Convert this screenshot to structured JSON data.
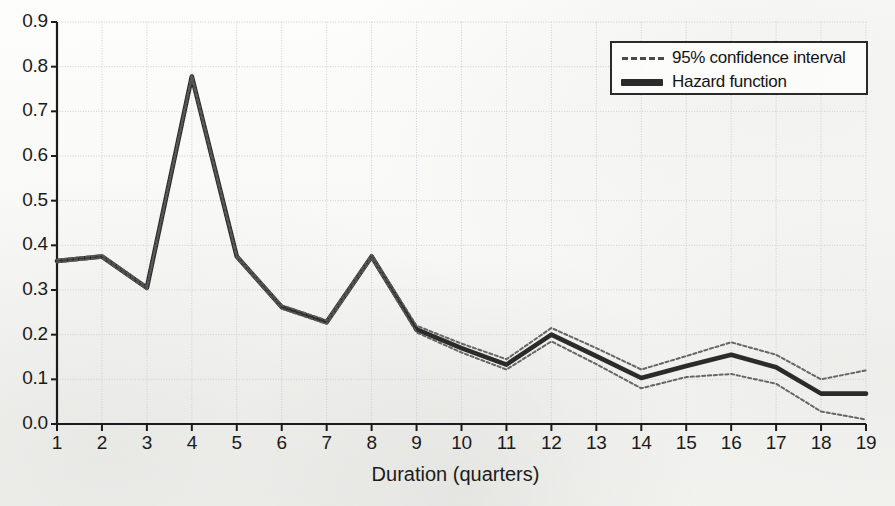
{
  "chart_data": {
    "type": "line",
    "title": "",
    "xlabel": "Duration (quarters)",
    "ylabel": "",
    "xlim": [
      1,
      19
    ],
    "ylim": [
      0.0,
      0.9
    ],
    "grid": true,
    "legend_position": "top-right",
    "x": [
      1,
      2,
      3,
      4,
      5,
      6,
      7,
      8,
      9,
      10,
      11,
      12,
      13,
      14,
      15,
      16,
      17,
      18,
      19
    ],
    "xtick_labels": [
      "1",
      "2",
      "3",
      "4",
      "5",
      "6",
      "7",
      "8",
      "9",
      "10",
      "11",
      "12",
      "13",
      "14",
      "15",
      "16",
      "17",
      "18",
      "19"
    ],
    "ytick_labels": [
      "0.0",
      "0.1",
      "0.2",
      "0.3",
      "0.4",
      "0.5",
      "0.6",
      "0.7",
      "0.8",
      "0.9"
    ],
    "ytick_values": [
      0.0,
      0.1,
      0.2,
      0.3,
      0.4,
      0.5,
      0.6,
      0.7,
      0.8,
      0.9
    ],
    "series": [
      {
        "name": "Hazard function",
        "style": "solid-thick",
        "color": "#2b2b2b",
        "values": [
          0.365,
          0.375,
          0.305,
          0.778,
          0.375,
          0.262,
          0.228,
          0.375,
          0.212,
          0.17,
          0.133,
          0.2,
          0.152,
          0.103,
          0.13,
          0.155,
          0.127,
          0.068,
          0.068
        ]
      },
      {
        "name": "95% confidence interval upper",
        "style": "dashed",
        "color": "#5a5a5a",
        "values": [
          0.368,
          0.378,
          0.308,
          0.782,
          0.378,
          0.266,
          0.232,
          0.379,
          0.22,
          0.18,
          0.145,
          0.215,
          0.17,
          0.122,
          0.152,
          0.183,
          0.155,
          0.1,
          0.12
        ]
      },
      {
        "name": "95% confidence interval lower",
        "style": "dashed",
        "color": "#5a5a5a",
        "values": [
          0.362,
          0.372,
          0.302,
          0.774,
          0.372,
          0.258,
          0.224,
          0.371,
          0.205,
          0.16,
          0.122,
          0.185,
          0.134,
          0.08,
          0.105,
          0.112,
          0.09,
          0.028,
          0.01
        ]
      }
    ],
    "legend": [
      {
        "label": "95% confidence interval",
        "marker": "dashed-line"
      },
      {
        "label": "Hazard function",
        "marker": "thick-solid-line"
      }
    ],
    "colors": {
      "line": "#2b2b2b",
      "ci": "#5a5a5a",
      "grid": "#c9cdd4",
      "axis": "#1b1b1b",
      "background": "#fbfbfa"
    }
  },
  "axes": {
    "x_title": "Duration (quarters)"
  }
}
